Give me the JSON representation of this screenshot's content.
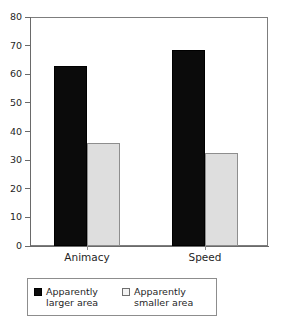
{
  "chart_data": {
    "type": "bar",
    "title": "",
    "subtitle": "",
    "xlabel": "",
    "ylabel": "",
    "categories": [
      "Animacy",
      "Speed"
    ],
    "series": [
      {
        "name": "Apparently larger area",
        "color": "#0b0b0b",
        "values": [
          63,
          68.5
        ]
      },
      {
        "name": "Apparently smaller area",
        "color": "#dedede",
        "values": [
          36,
          32.5
        ]
      }
    ],
    "ylim": [
      0,
      80
    ],
    "ytick_values": [
      0,
      10,
      20,
      30,
      40,
      50,
      60,
      70,
      80
    ],
    "ytick_labels": [
      "0",
      "10",
      "20",
      "30",
      "40",
      "50",
      "60",
      "70",
      "80"
    ],
    "grid": false,
    "legend_position": "bottom",
    "frame": "box"
  },
  "legend": {
    "entries": [
      {
        "swatch": "dark-square-swatch",
        "line1": "Apparently",
        "line2": "larger area"
      },
      {
        "swatch": "light-square-swatch",
        "line1": "Apparently",
        "line2": "smaller area"
      }
    ]
  },
  "axis": {
    "y_labels": [
      "80",
      "70",
      "60",
      "50",
      "40",
      "30",
      "20",
      "10",
      "0"
    ],
    "x_labels": [
      "Animacy",
      "Speed"
    ]
  }
}
